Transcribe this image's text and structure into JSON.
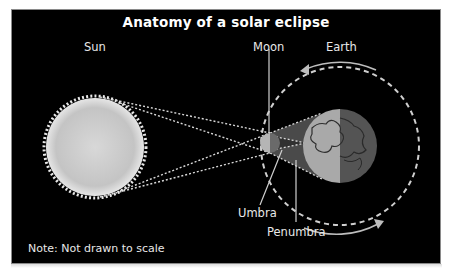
{
  "title": "Anatomy of a solar eclipse",
  "labels": {
    "sun": "Sun",
    "moon": "Moon",
    "earth": "Earth",
    "umbra": "Umbra",
    "penumbra": "Penumbra"
  },
  "note": "Note: Not drawn to scale",
  "colors": {
    "background": "#000000",
    "sun": "#cfcfcf",
    "earth_day": "#a9a9a9",
    "earth_night": "#545454",
    "penumbra": "#4a4a4a",
    "umbra": "#333333",
    "lines": "#d8d8d8"
  }
}
